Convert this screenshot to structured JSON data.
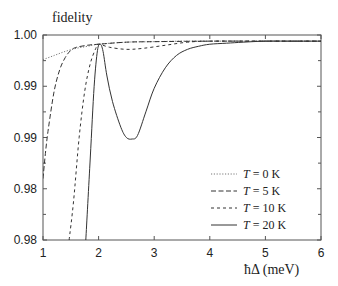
{
  "chart_data": {
    "type": "line",
    "title": "",
    "ylabel": "fidelity",
    "xlabel": "ħΔ (meV)",
    "xlim": [
      1,
      6
    ],
    "ylim": [
      0.98,
      1.0
    ],
    "x_ticks": [
      1,
      2,
      3,
      4,
      5,
      6
    ],
    "x_tick_labels": [
      "1",
      "2",
      "3",
      "4",
      "5",
      "6"
    ],
    "y_ticks": [
      0.98,
      0.985,
      0.99,
      0.995,
      1.0
    ],
    "y_tick_labels": [
      "0.98",
      "0.98",
      "0.99",
      "0.99",
      "1.00"
    ],
    "y_minor_ticks": [
      0.9825,
      0.9875,
      0.9925,
      0.9975
    ],
    "grid": false,
    "legend_position": "lower right",
    "series": [
      {
        "name": "T = 0 K",
        "style": "dotted",
        "x": [
          1.0,
          1.2,
          1.4,
          1.6,
          1.8,
          2.0,
          2.5,
          3.0,
          3.5,
          4.0,
          4.5,
          5.0,
          5.5,
          6.0
        ],
        "y": [
          0.9976,
          0.998,
          0.9984,
          0.9987,
          0.9989,
          0.9991,
          0.9993,
          0.99935,
          0.9994,
          0.9994,
          0.9994,
          0.9994,
          0.9994,
          0.9994
        ]
      },
      {
        "name": "T = 5 K",
        "style": "long-dash",
        "x": [
          1.0,
          1.05,
          1.1,
          1.2,
          1.3,
          1.4,
          1.5,
          1.6,
          1.8,
          2.0,
          2.5,
          3.0,
          4.0,
          5.0,
          6.0
        ],
        "y": [
          0.986,
          0.9888,
          0.991,
          0.9945,
          0.9966,
          0.9978,
          0.9985,
          0.9988,
          0.999,
          0.9991,
          0.9993,
          0.99935,
          0.9994,
          0.9994,
          0.9994
        ]
      },
      {
        "name": "T = 10 K",
        "style": "short-dash",
        "x": [
          1.47,
          1.55,
          1.65,
          1.75,
          1.85,
          1.95,
          2.0,
          2.2,
          2.5,
          2.8,
          3.2,
          3.6,
          4.0,
          5.0,
          6.0
        ],
        "y": [
          0.98,
          0.9838,
          0.99,
          0.9945,
          0.9972,
          0.9987,
          0.9991,
          0.9988,
          0.9986,
          0.9987,
          0.999,
          0.9993,
          0.9994,
          0.9994,
          0.9994
        ]
      },
      {
        "name": "T = 20 K",
        "style": "solid",
        "x": [
          1.77,
          1.85,
          1.92,
          1.98,
          2.03,
          2.08,
          2.15,
          2.25,
          2.4,
          2.5,
          2.6,
          2.7,
          2.85,
          3.0,
          3.2,
          3.4,
          3.6,
          3.8,
          4.0,
          4.3,
          4.6,
          5.0,
          5.5,
          6.0
        ],
        "y": [
          0.98,
          0.988,
          0.995,
          0.9985,
          0.9991,
          0.9984,
          0.996,
          0.9935,
          0.991,
          0.99,
          0.98985,
          0.9902,
          0.9925,
          0.9948,
          0.9968,
          0.998,
          0.9986,
          0.9989,
          0.9991,
          0.9992,
          0.9993,
          0.9994,
          0.9994,
          0.9994
        ]
      }
    ]
  },
  "labels": {
    "ylabel": "fidelity",
    "xlabel": "ħΔ (meV)",
    "legend": [
      {
        "var": "T",
        "rest": " = 0 K"
      },
      {
        "var": "T",
        "rest": " = 5 K"
      },
      {
        "var": "T",
        "rest": " = 10 K"
      },
      {
        "var": "T",
        "rest": " = 20 K"
      }
    ]
  },
  "colors": {
    "axis": "#555555",
    "line": "#333333",
    "dotted": "#777777"
  }
}
